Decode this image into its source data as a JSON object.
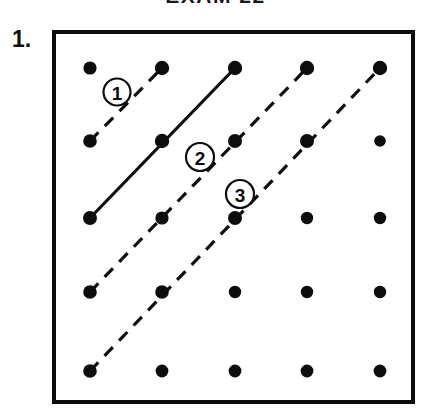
{
  "header": {
    "title": "EXAM 22"
  },
  "problem": {
    "number_label": "1."
  },
  "board": {
    "frame": {
      "x": 52,
      "y": 30,
      "width": 363,
      "height": 374
    },
    "grid": {
      "rows": 5,
      "cols": 5,
      "origin_x": 90,
      "origin_y": 68,
      "step_x": 72.5,
      "step_y": 75.75,
      "dot_radius": 6.2
    },
    "dots": [
      {
        "row": 0,
        "col": 0,
        "cx": 90,
        "cy": 68,
        "r": 6.6
      },
      {
        "row": 0,
        "col": 1,
        "cx": 162,
        "cy": 68,
        "r": 7.2
      },
      {
        "row": 0,
        "col": 2,
        "cx": 235,
        "cy": 68,
        "r": 7.2
      },
      {
        "row": 0,
        "col": 3,
        "cx": 307,
        "cy": 68,
        "r": 7.2
      },
      {
        "row": 0,
        "col": 4,
        "cx": 380,
        "cy": 68,
        "r": 7.2
      },
      {
        "row": 1,
        "col": 0,
        "cx": 90,
        "cy": 141,
        "r": 6.8
      },
      {
        "row": 1,
        "col": 1,
        "cx": 162,
        "cy": 141,
        "r": 7.2
      },
      {
        "row": 1,
        "col": 2,
        "cx": 235,
        "cy": 141,
        "r": 7.0
      },
      {
        "row": 1,
        "col": 3,
        "cx": 307,
        "cy": 141,
        "r": 7.0
      },
      {
        "row": 1,
        "col": 4,
        "cx": 380,
        "cy": 141,
        "r": 5.8
      },
      {
        "row": 2,
        "col": 0,
        "cx": 90,
        "cy": 218,
        "r": 7.0
      },
      {
        "row": 2,
        "col": 1,
        "cx": 162,
        "cy": 218,
        "r": 6.6
      },
      {
        "row": 2,
        "col": 2,
        "cx": 235,
        "cy": 218,
        "r": 7.0
      },
      {
        "row": 2,
        "col": 3,
        "cx": 307,
        "cy": 218,
        "r": 6.2
      },
      {
        "row": 2,
        "col": 4,
        "cx": 380,
        "cy": 218,
        "r": 6.2
      },
      {
        "row": 3,
        "col": 0,
        "cx": 90,
        "cy": 292,
        "r": 6.8
      },
      {
        "row": 3,
        "col": 1,
        "cx": 162,
        "cy": 292,
        "r": 6.8
      },
      {
        "row": 3,
        "col": 2,
        "cx": 235,
        "cy": 292,
        "r": 6.2
      },
      {
        "row": 3,
        "col": 3,
        "cx": 307,
        "cy": 292,
        "r": 6.2
      },
      {
        "row": 3,
        "col": 4,
        "cx": 380,
        "cy": 292,
        "r": 6.2
      },
      {
        "row": 4,
        "col": 0,
        "cx": 90,
        "cy": 371,
        "r": 6.8
      },
      {
        "row": 4,
        "col": 1,
        "cx": 162,
        "cy": 371,
        "r": 6.4
      },
      {
        "row": 4,
        "col": 2,
        "cx": 235,
        "cy": 371,
        "r": 6.4
      },
      {
        "row": 4,
        "col": 3,
        "cx": 307,
        "cy": 371,
        "r": 6.4
      },
      {
        "row": 4,
        "col": 4,
        "cx": 380,
        "cy": 371,
        "r": 6.4
      }
    ],
    "segments": [
      {
        "id": "segment-1",
        "style": "dashed",
        "from": {
          "cx": 90,
          "cy": 141
        },
        "to": {
          "cx": 162,
          "cy": 68
        },
        "grid_from": [
          1,
          0
        ],
        "grid_to": [
          0,
          1
        ],
        "length_units": 1
      },
      {
        "id": "segment-solid",
        "style": "solid",
        "from": {
          "cx": 90,
          "cy": 218
        },
        "to": {
          "cx": 235,
          "cy": 68
        },
        "grid_from": [
          2,
          0
        ],
        "grid_to": [
          0,
          2
        ],
        "length_units": 2
      },
      {
        "id": "segment-2",
        "style": "dashed",
        "from": {
          "cx": 90,
          "cy": 292
        },
        "to": {
          "cx": 307,
          "cy": 68
        },
        "grid_from": [
          3,
          0
        ],
        "grid_to": [
          0,
          3
        ],
        "length_units": 3
      },
      {
        "id": "segment-3",
        "style": "dashed",
        "from": {
          "cx": 90,
          "cy": 371
        },
        "to": {
          "cx": 380,
          "cy": 68
        },
        "grid_from": [
          4,
          0
        ],
        "grid_to": [
          0,
          4
        ],
        "length_units": 4
      }
    ],
    "labels": [
      {
        "id": "label-1",
        "text": "1",
        "cx": 117,
        "cy": 92,
        "r": 13.5
      },
      {
        "id": "label-2",
        "text": "2",
        "cx": 200,
        "cy": 157,
        "r": 14.0
      },
      {
        "id": "label-3",
        "text": "3",
        "cx": 240,
        "cy": 194,
        "r": 14.0
      }
    ]
  },
  "colors": {
    "ink": "#0d0d0d",
    "paper": "#ffffff"
  }
}
